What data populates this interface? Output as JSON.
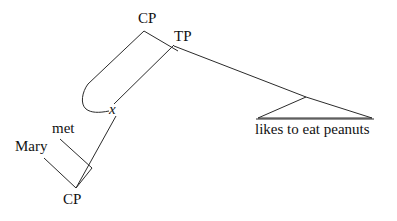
{
  "diagram": {
    "kind": "syntax-tree",
    "title": "",
    "line_color": "#2b2b2b",
    "text_color": "#111111",
    "background": "#ffffff",
    "nodes": {
      "cp_top": "CP",
      "tp": "TP",
      "trace": "x",
      "met": "met",
      "mary": "Mary",
      "cp_bottom": "CP",
      "phrase": "likes to eat peanuts"
    },
    "edges": [
      {
        "name": "cp-to-trace-movement",
        "from": "cp_top",
        "to": "trace",
        "style": "curved"
      },
      {
        "name": "cp-to-tp",
        "from": "cp_top",
        "to": "tp",
        "style": "straight"
      },
      {
        "name": "tp-to-trace",
        "from": "tp",
        "to": "trace",
        "style": "straight"
      },
      {
        "name": "tp-to-phrase",
        "from": "tp",
        "to": "phrase",
        "style": "straight"
      },
      {
        "name": "trace-to-cp-bottom",
        "from": "trace",
        "to": "cp_bottom",
        "style": "straight"
      },
      {
        "name": "met-to-cp-bottom",
        "from": "met",
        "to": "cp_bottom",
        "style": "straight"
      },
      {
        "name": "mary-to-cp-bottom",
        "from": "mary",
        "to": "cp_bottom",
        "style": "straight"
      }
    ],
    "triangle": {
      "name": "phrase-triangle",
      "apex_label": "",
      "base_label": "likes to eat peanuts"
    }
  }
}
